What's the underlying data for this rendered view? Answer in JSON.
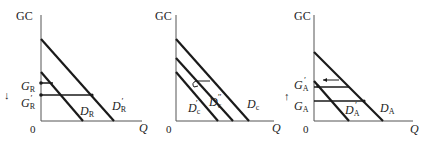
{
  "panels": [
    {
      "id": "rail",
      "y_axis_label": "GC",
      "x_axis_label": "Q",
      "origin_label": "0",
      "curves": [
        {
          "name": "D_R",
          "label_main": "D",
          "label_sub": "R",
          "prime": ""
        },
        {
          "name": "D'_R",
          "label_main": "D",
          "label_sub": "R",
          "prime": "′"
        }
      ],
      "price_levels": [
        {
          "name": "G_R",
          "label_main": "G",
          "label_sub": "R",
          "prime": ""
        },
        {
          "name": "G'_R",
          "label_main": "G",
          "label_sub": "R",
          "prime": "′"
        }
      ],
      "shift_arrow": "↓"
    },
    {
      "id": "car",
      "y_axis_label": "GC",
      "x_axis_label": "Q",
      "origin_label": "0",
      "curves": [
        {
          "name": "D'_c",
          "label_main": "D",
          "label_sub": "c",
          "prime": "′"
        },
        {
          "name": "D''_c",
          "label_main": "D",
          "label_sub": "c",
          "prime": "″"
        },
        {
          "name": "D_c",
          "label_main": "D",
          "label_sub": "c",
          "prime": ""
        }
      ]
    },
    {
      "id": "air",
      "y_axis_label": "GC",
      "x_axis_label": "Q",
      "origin_label": "0",
      "curves": [
        {
          "name": "D'_A",
          "label_main": "D",
          "label_sub": "A",
          "prime": "′"
        },
        {
          "name": "D_A",
          "label_main": "D",
          "label_sub": "A",
          "prime": ""
        }
      ],
      "price_levels": [
        {
          "name": "G'_A",
          "label_main": "G",
          "label_sub": "A",
          "prime": "′"
        },
        {
          "name": "G_A",
          "label_main": "G",
          "label_sub": "A",
          "prime": ""
        }
      ],
      "shift_arrow": "↑"
    }
  ],
  "colors": {
    "line": "#1a1a1a",
    "axis": "#555555"
  }
}
